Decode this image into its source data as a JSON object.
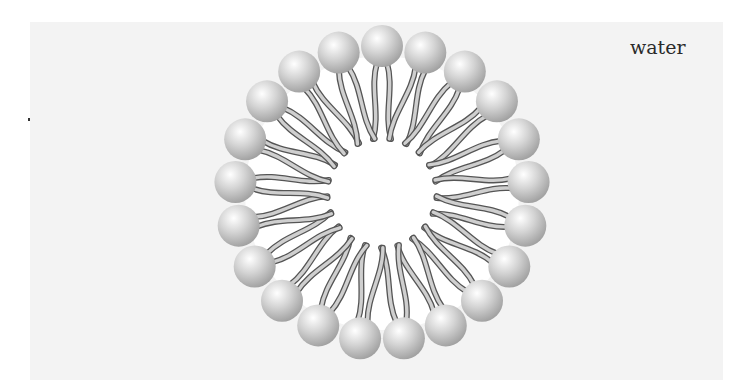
{
  "diagram": {
    "labels": {
      "solvent": "water"
    },
    "micelle": {
      "center": [
        382,
        193
      ],
      "head_count": 21,
      "head_radius": 21,
      "ring_radius": 147,
      "core_radius": 52,
      "tails_per_head": 2,
      "colors": {
        "panel": "#f3f3f3",
        "core": "#ffffff",
        "head_light": "#ffffff",
        "head_mid": "#d4d4d4",
        "head_dark": "#9a9a9a",
        "tail_fill": "#cfcfcf",
        "tail_outline": "#555555"
      }
    }
  }
}
